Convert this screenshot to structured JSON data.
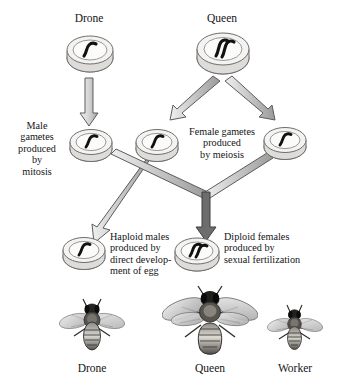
{
  "figure": {
    "background_color": "#ffffff",
    "ink_color": "#141414",
    "cell_fill": "#f2f1ef",
    "cell_stroke": "#6e6e6e",
    "arrow_fill": "#b9b9b9",
    "arrow_stroke": "#4a4a4a"
  },
  "parents": [
    {
      "id": "parent-drone",
      "label": "Drone",
      "ploidy": "haploid",
      "chromosomes": 1
    },
    {
      "id": "parent-queen",
      "label": "Queen",
      "ploidy": "diploid",
      "chromosomes": 2
    }
  ],
  "gamete_captions": [
    {
      "id": "male-gametes-caption",
      "text": "Male\ngametes\nproduced\nby\nmitosis",
      "align": "center"
    },
    {
      "id": "female-gametes-caption",
      "text": "Female gametes\nproduced\nby meiosis",
      "align": "center"
    }
  ],
  "gametes": [
    {
      "id": "male-gamete",
      "ploidy": "haploid",
      "chromosomes": 1
    },
    {
      "id": "female-gamete-left",
      "ploidy": "haploid",
      "chromosomes": 1
    },
    {
      "id": "female-gamete-right",
      "ploidy": "haploid",
      "chromosomes": 1
    }
  ],
  "offspring": [
    {
      "id": "haploid-males",
      "caption": "Haploid males\nproduced by\ndirect develop-\nment of egg",
      "ploidy": "haploid",
      "chromosomes": 1
    },
    {
      "id": "diploid-females",
      "caption": "Diploid females\nproduced by\nsexual fertilization",
      "ploidy": "diploid",
      "chromosomes": 2
    }
  ],
  "castes": [
    {
      "id": "caste-drone",
      "label": "Drone",
      "size": "medium"
    },
    {
      "id": "caste-queen",
      "label": "Queen",
      "size": "large"
    },
    {
      "id": "caste-worker",
      "label": "Worker",
      "size": "small"
    }
  ]
}
